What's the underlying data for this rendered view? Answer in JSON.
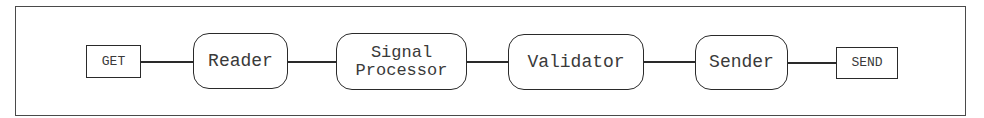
{
  "diagram": {
    "title": "",
    "nodes": [
      {
        "id": "get",
        "label": "GET",
        "shape": "rectangle"
      },
      {
        "id": "reader",
        "label": "Reader",
        "shape": "rounded-rectangle"
      },
      {
        "id": "signal_processor",
        "label": "Signal\nProcessor",
        "shape": "rounded-rectangle",
        "lines": [
          "Signal",
          "Processor"
        ]
      },
      {
        "id": "validator",
        "label": "Validator",
        "shape": "rounded-rectangle"
      },
      {
        "id": "sender",
        "label": "Sender",
        "shape": "rounded-rectangle"
      },
      {
        "id": "send",
        "label": "SEND",
        "shape": "rectangle"
      }
    ],
    "edges": [
      {
        "from": "get",
        "to": "reader"
      },
      {
        "from": "reader",
        "to": "signal_processor"
      },
      {
        "from": "signal_processor",
        "to": "validator"
      },
      {
        "from": "validator",
        "to": "sender"
      },
      {
        "from": "sender",
        "to": "send"
      }
    ],
    "colors": {
      "stroke": "#2a2a2a",
      "text": "#3a3a3a",
      "background": "#ffffff"
    }
  }
}
